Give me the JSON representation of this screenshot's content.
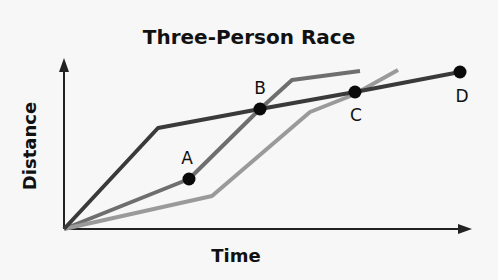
{
  "chart_data": {
    "type": "line",
    "title": "Three-Person Race",
    "xlabel": "Time",
    "ylabel": "Distance",
    "grid": false,
    "legend": null,
    "axis_ticks": "none",
    "coordinate_note": "Unitless schematic; coordinates expressed in plot pixels from origin (x right, y up)",
    "series": [
      {
        "name": "Runner 1 (dark)",
        "color": "#3a3a3a",
        "points": [
          [
            0,
            0
          ],
          [
            94,
            101
          ],
          [
            196,
            120
          ],
          [
            291,
            137
          ],
          [
            396,
            157
          ]
        ]
      },
      {
        "name": "Runner 2 (medium)",
        "color": "#6e6e6e",
        "points": [
          [
            0,
            0
          ],
          [
            125,
            50
          ],
          [
            196,
            120
          ],
          [
            228,
            149
          ],
          [
            296,
            158
          ]
        ]
      },
      {
        "name": "Runner 3 (light)",
        "color": "#9a9a9a",
        "points": [
          [
            0,
            0
          ],
          [
            148,
            33
          ],
          [
            246,
            117
          ],
          [
            289,
            134
          ],
          [
            334,
            159
          ]
        ]
      }
    ],
    "annotations": [
      {
        "label": "A",
        "point": [
          125,
          50
        ],
        "label_pos": "above"
      },
      {
        "label": "B",
        "point": [
          196,
          120
        ],
        "label_pos": "above"
      },
      {
        "label": "C",
        "point": [
          291,
          137
        ],
        "label_pos": "below"
      },
      {
        "label": "D",
        "point": [
          396,
          157
        ],
        "label_pos": "below"
      }
    ]
  },
  "svg": {
    "origin": [
      64,
      229
    ],
    "lines": [
      {
        "name": "dark-line",
        "color": "#3a3a3a",
        "pts": "64,229 158,128 260,109 355,92 460,72"
      },
      {
        "name": "medium-line",
        "color": "#6e6e6e",
        "pts": "64,229 189,179 260,109 292,80 360,71"
      },
      {
        "name": "light-line",
        "color": "#9a9a9a",
        "pts": "64,229 212,196 310,112 353,95 398,70"
      }
    ],
    "dots": [
      {
        "label": "A",
        "cx": 189,
        "cy": 179,
        "lx": 187,
        "ly": 164
      },
      {
        "label": "B",
        "cx": 260,
        "cy": 109,
        "lx": 260,
        "ly": 94
      },
      {
        "label": "C",
        "cx": 355,
        "cy": 92,
        "lx": 356,
        "ly": 121
      },
      {
        "label": "D",
        "cx": 460,
        "cy": 72,
        "lx": 462,
        "ly": 102
      }
    ]
  }
}
